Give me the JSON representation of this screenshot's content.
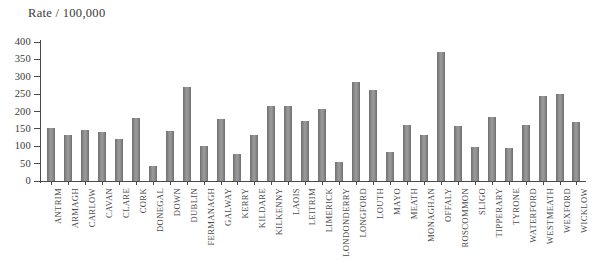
{
  "chart_data": {
    "type": "bar",
    "title": "",
    "ylabel": "Rate / 100,000",
    "xlabel": "",
    "ylim": [
      0,
      400
    ],
    "yticks": [
      0,
      50,
      100,
      150,
      200,
      250,
      300,
      350,
      400
    ],
    "grid": false,
    "legend": null,
    "bar_color": "#8a8a8a",
    "axis_color": "#4a4a4a",
    "categories": [
      "ANTRIM",
      "ARMAGH",
      "CARLOW",
      "CAVAN",
      "CLARE",
      "CORK",
      "DONEGAL",
      "DOWN",
      "DUBLIN",
      "FERMANAGH",
      "GALWAY",
      "KERRY",
      "KILDARE",
      "KILKENNY",
      "LAOIS",
      "LEITRIM",
      "LIMERICK",
      "LONDONDERRY",
      "LONGFORD",
      "LOUTH",
      "MAYO",
      "MEATH",
      "MONAGHAN",
      "OFFALY",
      "ROSCOMMON",
      "SLIGO",
      "TIPPERARY",
      "TYRONE",
      "WATERFORD",
      "WESTMEATH",
      "WEXFORD",
      "WICKLOW"
    ],
    "values": [
      152,
      133,
      148,
      140,
      120,
      180,
      42,
      143,
      270,
      100,
      178,
      78,
      133,
      215,
      215,
      172,
      207,
      55,
      285,
      262,
      83,
      160,
      133,
      371,
      158,
      97,
      185,
      95,
      160,
      245,
      250,
      170
    ]
  }
}
